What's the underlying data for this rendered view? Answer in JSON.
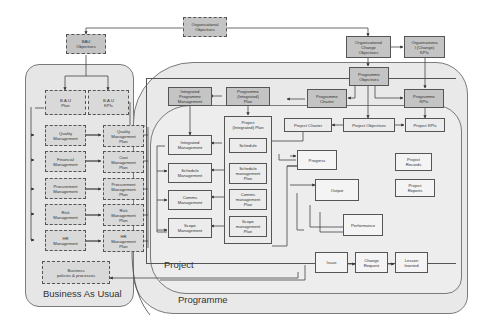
{
  "diagram": {
    "regions": {
      "business_as_usual": "Business As Usual",
      "programme": "Programme",
      "project": "Project"
    },
    "top": {
      "organisational_objectives": "Organisational\nObjectives",
      "bau_objectives": "BAU\nObjectives",
      "organisational_change_objectives": "Organisational\nChange\nObjectives",
      "organisational_change_kpis": "Organisationa\nl (Change)\nKPIs"
    },
    "bau": {
      "bau_plan": "B.A.U\nPlan",
      "bau_kpis": "B.A.U\nKPIs",
      "management": [
        "Quality\nManagement",
        "Financial\nManagement",
        "Procurement\nManagement",
        "Risk\nManagement",
        "HR\nManagement"
      ],
      "plans": [
        "Quality\nManagement\nPlan",
        "Cost\nManagement\nPlan",
        "Procurement\nManagement\nPlan",
        "Risk\nManagement\nPlan",
        "HR\nManagement\nPlan"
      ],
      "business_policies": "Business\npolicies & processes"
    },
    "programme": {
      "programme_objectives": "Programme\nObjectives",
      "integrated_programme_management": "Integrated\nProgramme\nManagement",
      "programme_integrated_plan": "Programme\n(Integrated)\nPlan",
      "programme_charter": "Programme\nCharter",
      "programme_kpis": "Programme\nKPIs"
    },
    "project": {
      "project_charter": "Project Charter",
      "project_objectives": "Project Objectives",
      "project_kpis": "Project KPIs",
      "project_integrated_plan": "Project\n(Integrated) Plan",
      "management": [
        "Integrated\nManagement",
        "Schedule\nManagement",
        "Comms\nManagement",
        "Scope\nManagement"
      ],
      "plans": [
        "Schedule",
        "Schedule\nmanagement\nPlan",
        "Comms\nmanagement\nPlan",
        "Scope\nmanagement\nPlan"
      ],
      "progress": "Progress",
      "output": "Output",
      "performance": "Performance",
      "project_records": "Project\nRecords",
      "project_reports": "Project\nReports",
      "issue": "Issue",
      "change_request": "Change\nRequest",
      "lesson_learned": "Lesson\nlearned"
    }
  }
}
